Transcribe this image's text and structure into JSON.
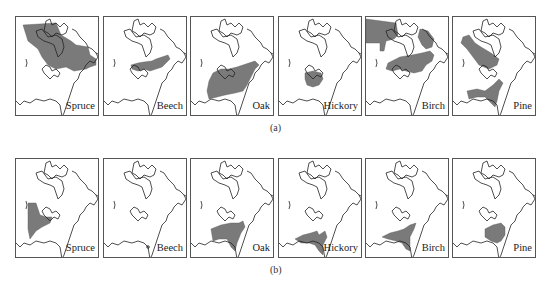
{
  "figure": {
    "fill_color": "#7a7a7a",
    "outline_color": "#222222",
    "rows": [
      {
        "caption": "(a)",
        "panels": [
          {
            "label": "Spruce",
            "range": [
              "M7,8 L40,6 L45,18 L55,24 L60,28 L72,30 L74,38 L80,42 L80,48 L74,50 L70,52 L58,54 L50,50 L40,52 L32,48 L26,40 L22,32 L12,24 Z"
            ]
          },
          {
            "label": "Beech",
            "range": [
              "M27,48 L34,46 L40,45 L48,44 L52,42 L58,40 L64,38 L66,42 L62,46 L58,50 L52,52 L46,54 L40,52 L34,54 L28,52 Z"
            ]
          },
          {
            "label": "Oak",
            "range": [
              "M22,56 L30,52 L38,52 L46,50 L52,48 L58,46 L64,44 L68,48 L64,52 L60,60 L56,68 L52,74 L44,76 L34,78 L26,80 L18,82 L16,74 L18,64 Z"
            ]
          },
          {
            "label": "Hickory",
            "range": [
              "M26,56 L34,54 L42,56 L44,62 L40,68 L34,70 L28,68 L26,62 Z"
            ]
          },
          {
            "label": "Birch",
            "range": [
              "M0,2 L30,6 L32,18 L28,22 L20,24 L18,34 L14,34 L14,26 L0,26 Z",
              "M54,12 L62,14 L68,22 L66,30 L60,32 L56,28 L52,20 Z",
              "M22,46 L34,40 L46,38 L56,36 L64,34 L68,38 L66,44 L60,48 L56,54 L48,56 L40,54 L34,52 L26,54 L20,52 Z"
            ]
          },
          {
            "label": "Pine",
            "range": [
              "M10,20 L16,18 L22,26 L28,30 L38,36 L46,42 L44,48 L36,52 L26,48 L20,40 L14,32 L8,26 Z",
              "M14,74 L24,72 L32,74 L40,68 L46,62 L50,66 L46,74 L44,84 L42,90 L38,86 L32,80 L24,80 L16,82 Z"
            ]
          }
        ]
      },
      {
        "caption": "(b)",
        "panels": [
          {
            "label": "Spruce",
            "range": [
              "M12,44 L20,44 L22,50 L24,56 L30,58 L36,58 L34,64 L26,68 L20,72 L14,80 L12,70 L12,56 Z"
            ]
          },
          {
            "label": "Beech",
            "range": [
              "M42,88 L44,86 L46,88 L44,90 Z"
            ]
          },
          {
            "label": "Oak",
            "range": [
              "M20,70 L30,66 L40,64 L48,64 L52,62 L54,68 L50,74 L46,84 L44,92 L40,88 L36,80 L28,80 L22,82 Z"
            ]
          },
          {
            "label": "Hickory",
            "range": [
              "M16,80 L24,76 L32,74 L38,72 L40,76 L46,72 L48,78 L44,86 L44,96 L40,92 L36,86 L30,84 L22,84 Z"
            ]
          },
          {
            "label": "Birch",
            "range": [
              "M16,78 L24,74 L32,72 L38,70 L44,66 L50,64 L48,70 L44,78 L44,92 L40,90 L36,84 L30,82 L22,80 Z"
            ]
          },
          {
            "label": "Pine",
            "range": [
              "M32,70 L40,66 L48,64 L52,68 L52,76 L48,82 L44,84 L38,82 L32,78 Z"
            ]
          }
        ]
      }
    ]
  }
}
